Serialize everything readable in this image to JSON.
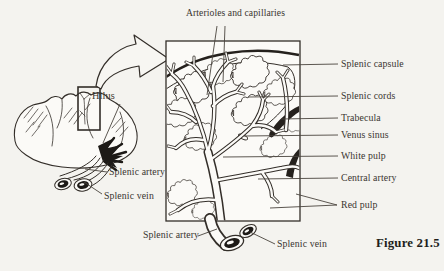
{
  "figure": {
    "caption": "Figure 21.5"
  },
  "overview_panel": {
    "labels": {
      "hilus": "Hilus",
      "splenic_artery": "Splenic artery",
      "splenic_vein": "Splenic vein"
    }
  },
  "magnified_panel": {
    "top_label": "Arterioles and capillaries",
    "right_labels": {
      "splenic_capsule": "Splenic capsule",
      "splenic_cords": "Splenic cords",
      "trabecula": "Trabecula",
      "venus_sinus": "Venus sinus",
      "white_pulp": "White pulp",
      "central_artery": "Central artery",
      "red_pulp": "Red pulp"
    },
    "bottom_labels": {
      "splenic_artery": "Splenic artery",
      "splenic_vein": "Splenic vein"
    }
  },
  "colors": {
    "ink": "#332e29",
    "leader_line": "#4a443d",
    "label_text": "#3a352f",
    "background": "#f4f3ef",
    "paper_fill": "#fbfaf7"
  }
}
